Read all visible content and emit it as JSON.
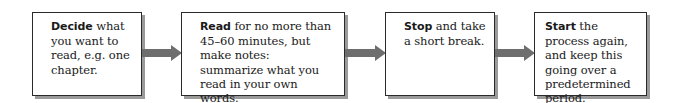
{
  "diagram": {
    "type": "flowchart",
    "direction": "left-to-right",
    "steps": [
      {
        "lead": "Decide",
        "rest": " what you want to read, e.g. one chapter."
      },
      {
        "lead": "Read",
        "rest": " for no more than 45–60 minutes, but make notes: summarize what you read in your own words."
      },
      {
        "lead": "Stop",
        "rest": " and take a short break."
      },
      {
        "lead": "Start",
        "rest": " the process again, and keep this going over a predetermined period."
      }
    ],
    "connectors": [
      {
        "from": 0,
        "to": 1,
        "icon": "arrow-right-icon"
      },
      {
        "from": 1,
        "to": 2,
        "icon": "arrow-right-icon"
      },
      {
        "from": 2,
        "to": 3,
        "icon": "arrow-right-icon"
      }
    ],
    "colors": {
      "box_border": "#2a2a2a",
      "box_shadow": "#9a9a9a",
      "arrow": "#6e6e6e",
      "background": "#ffffff"
    }
  }
}
